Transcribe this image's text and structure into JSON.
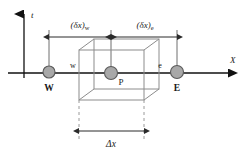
{
  "figure": {
    "axes": {
      "x_label": "X",
      "t_label": "t"
    },
    "nodes": [
      {
        "id": "W",
        "label": "W",
        "cx": 49,
        "cy": 72,
        "r": 6
      },
      {
        "id": "P",
        "label": "P",
        "cx": 111,
        "cy": 73,
        "r": 6.5
      },
      {
        "id": "E",
        "label": "E",
        "cx": 177,
        "cy": 72,
        "r": 6.5
      }
    ],
    "faces": [
      {
        "id": "w",
        "label": "w",
        "x": 73,
        "y": 66
      },
      {
        "id": "e",
        "label": "e",
        "x": 160,
        "y": 66
      }
    ],
    "dimensions": [
      {
        "id": "dx-w",
        "label_main": "(δx)",
        "label_sub": "w",
        "from": 49,
        "to": 111,
        "y": 37
      },
      {
        "id": "dx-e",
        "label_main": "(δx)",
        "label_sub": "e",
        "from": 111,
        "to": 177,
        "y": 37
      },
      {
        "id": "delta-x",
        "label_main": "Δx",
        "label_sub": "",
        "from": 79,
        "to": 144,
        "y": 131
      }
    ],
    "colors": {
      "line": "#2b2b2b",
      "box_line": "#8c8c8c",
      "node_fill": "#a8a8a8",
      "node_stroke": "#5a5a5a",
      "dashed": "#9a9a9a",
      "background": "#ffffff"
    }
  }
}
